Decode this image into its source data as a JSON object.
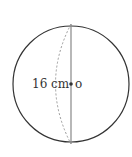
{
  "diagram": {
    "shape": "sphere",
    "diameter_label": "16 cm",
    "center_label": "o",
    "colors": {
      "outline": "#333333",
      "diameter_line": "#888888",
      "dashed_arc": "#999999",
      "text": "#333333"
    }
  }
}
